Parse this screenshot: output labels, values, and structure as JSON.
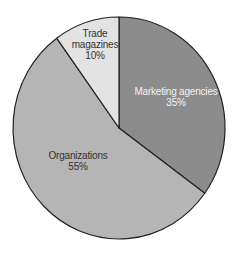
{
  "chart_data": {
    "type": "pie",
    "title": "",
    "start_angle_deg": -90,
    "direction": "clockwise",
    "legend": "none (labels inside slices)",
    "slices": [
      {
        "label": "Marketing agencies",
        "value": 35,
        "value_label": "35%",
        "color": "#8c8c8c",
        "text_color": "#f2f2f2"
      },
      {
        "label": "Organizations",
        "value": 55,
        "value_label": "55%",
        "color": "#b5b5b5",
        "text_color": "#333333"
      },
      {
        "label": "Trade magazines",
        "value": 10,
        "value_label": "10%",
        "color": "#e3e3e3",
        "text_color": "#333333"
      }
    ]
  },
  "labels": {
    "marketing": {
      "line1": "Marketing agencies",
      "line2": "35%"
    },
    "organizations": {
      "line1": "Organizations",
      "line2": "55%"
    },
    "trade": {
      "line1": "Trade",
      "line2": "magazines",
      "line3": "10%"
    }
  }
}
